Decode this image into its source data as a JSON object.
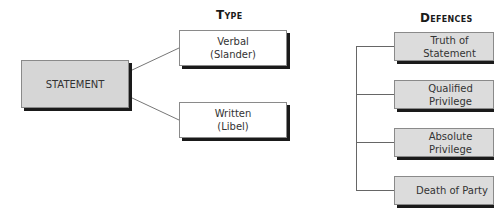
{
  "root": {
    "label": "STATEMENT"
  },
  "type": {
    "heading": "Type",
    "items": [
      {
        "line1": "Verbal",
        "line2": "(Slander)"
      },
      {
        "line1": "Written",
        "line2": "(Libel)"
      }
    ]
  },
  "defences": {
    "heading": "Defences",
    "items": [
      {
        "label": "Truth of Statement"
      },
      {
        "label": "Qualified Privilege"
      },
      {
        "label": "Absolute Privilege"
      },
      {
        "label": "Death of Party"
      }
    ]
  },
  "colors": {
    "root_fill": "#d6d6d6",
    "defence_fill": "#dcdcdc",
    "type_fill": "#ffffff",
    "shadow": "#1a1a1a",
    "line": "#666666"
  }
}
